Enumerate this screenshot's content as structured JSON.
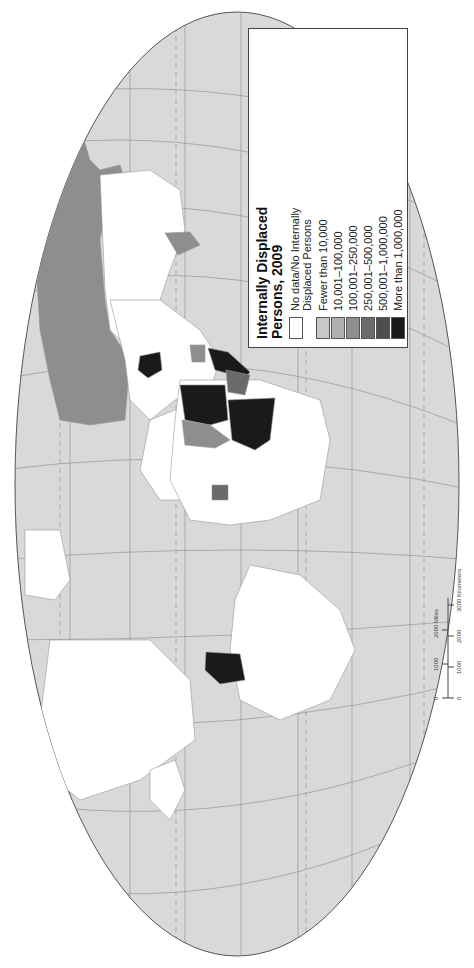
{
  "map": {
    "title": "Internally Displaced Persons, 2009",
    "title_lines": [
      "Internally Displaced",
      "Persons, 2009"
    ],
    "orientation": "rotated 90 degrees counterclockwise",
    "ocean_color": "#d9d9d9",
    "land_no_data_color": "#ffffff",
    "graticule_color": "#888888"
  },
  "legend": {
    "items": [
      {
        "label": "No data/No Internally",
        "label2": "Displaced Persons",
        "color": "#ffffff"
      },
      {
        "label": "Fewer than 10,000",
        "color": "#c8c8c8"
      },
      {
        "label": "10,001–100,000",
        "color": "#b0b0b0"
      },
      {
        "label": "100,001–250,000",
        "color": "#8e8e8e"
      },
      {
        "label": "250,001–500,000",
        "color": "#6a6a6a"
      },
      {
        "label": "500,001–1,000,000",
        "color": "#4e4e4e"
      },
      {
        "label": "More than 1,000,000",
        "color": "#1a1a1a"
      }
    ]
  },
  "scale_bar": {
    "miles_labels": [
      "0",
      "1000",
      "2000 Miles"
    ],
    "km_labels": [
      "0",
      "1000",
      "2000",
      "3000 Kilometers"
    ]
  }
}
